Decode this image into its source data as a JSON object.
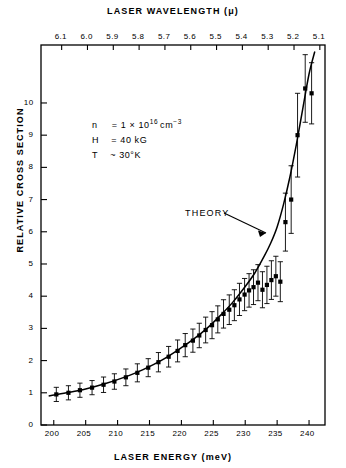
{
  "figure": {
    "top_axis_title": "LASER WAVELENGTH (μ)",
    "bottom_axis_title": "LASER ENERGY (meV)",
    "y_axis_title": "RELATIVE CROSS SECTION",
    "theory_label": "THEORY"
  },
  "annotation": {
    "density_symbol": "n",
    "density_eq": "=",
    "density_value": "1 × 10",
    "density_exp": "16",
    "density_unit": "cm",
    "density_unit_exp": "−3",
    "field_symbol": "H",
    "field_eq": "=",
    "field_value": "40 kG",
    "temp_symbol": "T",
    "temp_eq": "~",
    "temp_value": "30°K"
  },
  "chart_data": {
    "type": "scatter",
    "title": "",
    "xlabel": "LASER ENERGY (meV)",
    "ylabel": "RELATIVE CROSS SECTION",
    "x2label": "LASER WAVELENGTH (μ)",
    "xlim": [
      198,
      242.5
    ],
    "ylim": [
      0,
      11.8
    ],
    "x2lim": [
      6.18,
      5.08
    ],
    "grid": false,
    "legend": "none",
    "xticks": [
      200,
      205,
      210,
      215,
      220,
      225,
      230,
      235,
      240
    ],
    "xtick_labels": [
      "200",
      "205",
      "210",
      "215",
      "220",
      "225",
      "230",
      "235",
      "240"
    ],
    "yticks": [
      0,
      1,
      2,
      3,
      4,
      5,
      6,
      7,
      8,
      9,
      10
    ],
    "ytick_labels": [
      "0",
      "1",
      "2",
      "3",
      "4",
      "5",
      "6",
      "7",
      "8",
      "9",
      "10"
    ],
    "x2ticks": [
      6.1,
      6.0,
      5.9,
      5.8,
      5.7,
      5.6,
      5.5,
      5.4,
      5.3,
      5.2,
      5.1
    ],
    "x2tick_labels": [
      "6.1",
      "6.0",
      "5.9",
      "5.8",
      "5.7",
      "5.6",
      "5.5",
      "5.4",
      "5.3",
      "5.2",
      "5.1"
    ],
    "series": [
      {
        "name": "measured",
        "marker": "filled-square",
        "x": [
          200.4,
          202.3,
          204.1,
          206.0,
          207.8,
          209.5,
          211.3,
          213.1,
          214.8,
          216.4,
          218.0,
          219.4,
          220.6,
          221.8,
          222.8,
          223.8,
          224.8,
          225.7,
          226.6,
          227.5,
          228.3,
          229.1,
          229.9,
          230.6,
          231.3,
          232.0,
          232.7,
          233.4,
          234.1,
          234.8,
          235.5,
          236.3,
          237.2,
          238.2,
          239.4,
          240.4
        ],
        "y": [
          0.95,
          1.0,
          1.08,
          1.16,
          1.25,
          1.35,
          1.48,
          1.62,
          1.78,
          1.95,
          2.12,
          2.3,
          2.48,
          2.62,
          2.78,
          2.95,
          3.1,
          3.28,
          3.45,
          3.58,
          3.72,
          3.9,
          4.05,
          4.18,
          4.28,
          4.42,
          4.2,
          4.35,
          4.5,
          4.62,
          4.45,
          6.3,
          7.0,
          9.0,
          10.45,
          10.3
        ],
        "yerr": [
          0.22,
          0.22,
          0.22,
          0.22,
          0.24,
          0.24,
          0.26,
          0.28,
          0.28,
          0.3,
          0.32,
          0.34,
          0.36,
          0.36,
          0.38,
          0.4,
          0.42,
          0.42,
          0.44,
          0.46,
          0.48,
          0.5,
          0.5,
          0.52,
          0.54,
          0.56,
          0.56,
          0.58,
          0.6,
          0.62,
          0.62,
          0.9,
          1.05,
          1.3,
          1.05,
          0.95
        ]
      },
      {
        "name": "theory",
        "marker": "line",
        "x": [
          199.2,
          202.0,
          205.0,
          208.0,
          211.0,
          214.0,
          217.0,
          220.0,
          222.0,
          224.0,
          226.0,
          228.0,
          230.0,
          231.5,
          233.0,
          234.0,
          235.0,
          236.0,
          237.0,
          238.0,
          239.0,
          240.0,
          240.9
        ],
        "y": [
          0.9,
          1.0,
          1.12,
          1.28,
          1.48,
          1.72,
          2.02,
          2.4,
          2.68,
          3.0,
          3.38,
          3.8,
          4.3,
          4.72,
          5.25,
          5.65,
          6.15,
          6.85,
          7.7,
          8.7,
          9.8,
          10.9,
          11.6
        ]
      }
    ]
  }
}
